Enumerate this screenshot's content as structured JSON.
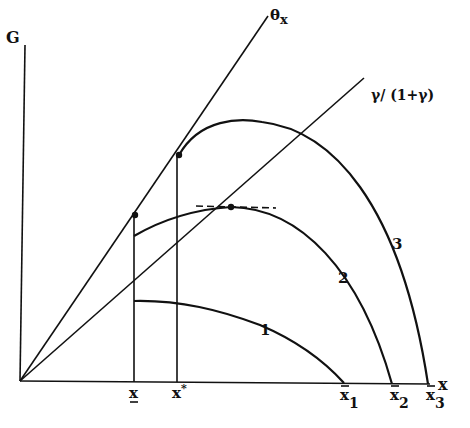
{
  "diagram": {
    "axes": {
      "y_label": "G",
      "x_label": "x"
    },
    "rays": [
      {
        "id": "theta",
        "label_main": "θ",
        "label_sub": "x"
      },
      {
        "id": "gamma",
        "label": "γ/ (1+γ)"
      }
    ],
    "curves": [
      {
        "id": "1",
        "label": "1"
      },
      {
        "id": "2",
        "label": "2"
      },
      {
        "id": "3",
        "label": "3"
      }
    ],
    "x_ticks": [
      {
        "id": "x_low",
        "label": "x"
      },
      {
        "id": "x_star",
        "label": "x",
        "sup": "*"
      },
      {
        "id": "xbar1",
        "label": "x",
        "sub": "1"
      },
      {
        "id": "xbar2",
        "label": "x",
        "sub": "2"
      },
      {
        "id": "xbar3",
        "label": "x",
        "sub": "3"
      }
    ],
    "colors": {
      "ink": "#111111",
      "background": "#ffffff"
    }
  }
}
